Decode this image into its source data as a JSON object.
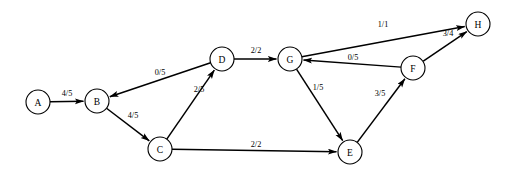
{
  "diagram": {
    "type": "flow-network",
    "label_format": "flow/capacity",
    "background_color": "#ffffff",
    "stroke_color": "#000000",
    "node_radius": 12,
    "nodes": [
      {
        "id": "A",
        "label": "A",
        "x": 38,
        "y": 102
      },
      {
        "id": "B",
        "label": "B",
        "x": 97,
        "y": 101
      },
      {
        "id": "C",
        "label": "C",
        "x": 160,
        "y": 149
      },
      {
        "id": "D",
        "label": "D",
        "x": 222,
        "y": 59
      },
      {
        "id": "E",
        "label": "E",
        "x": 350,
        "y": 152
      },
      {
        "id": "F",
        "label": "F",
        "x": 413,
        "y": 68
      },
      {
        "id": "G",
        "label": "G",
        "x": 290,
        "y": 59
      },
      {
        "id": "H",
        "label": "H",
        "x": 478,
        "y": 24
      }
    ],
    "edges": [
      {
        "id": "A-B",
        "from": "A",
        "to": "B",
        "label": "4/5",
        "flow": 4,
        "capacity": 5,
        "lx": 67,
        "ly": 93
      },
      {
        "id": "D-B",
        "from": "D",
        "to": "B",
        "label": "0/5",
        "flow": 0,
        "capacity": 5,
        "lx": 160,
        "ly": 72
      },
      {
        "id": "B-C",
        "from": "B",
        "to": "C",
        "label": "4/5",
        "flow": 4,
        "capacity": 5,
        "lx": 133,
        "ly": 115
      },
      {
        "id": "C-D",
        "from": "C",
        "to": "D",
        "label": "2/5",
        "flow": 2,
        "capacity": 5,
        "lx": 199,
        "ly": 89
      },
      {
        "id": "D-G",
        "from": "D",
        "to": "G",
        "label": "2/2",
        "flow": 2,
        "capacity": 2,
        "lx": 256,
        "ly": 50
      },
      {
        "id": "G-E",
        "from": "G",
        "to": "E",
        "label": "1/5",
        "flow": 1,
        "capacity": 5,
        "lx": 318,
        "ly": 87
      },
      {
        "id": "C-E",
        "from": "C",
        "to": "E",
        "label": "2/2",
        "flow": 2,
        "capacity": 2,
        "lx": 256,
        "ly": 144
      },
      {
        "id": "E-F",
        "from": "E",
        "to": "F",
        "label": "3/5",
        "flow": 3,
        "capacity": 5,
        "lx": 380,
        "ly": 93
      },
      {
        "id": "F-G",
        "from": "F",
        "to": "G",
        "label": "0/5",
        "flow": 0,
        "capacity": 5,
        "lx": 353,
        "ly": 57
      },
      {
        "id": "G-H",
        "from": "G",
        "to": "H",
        "label": "1/1",
        "flow": 1,
        "capacity": 1,
        "lx": 383,
        "ly": 24
      },
      {
        "id": "F-H",
        "from": "F",
        "to": "H",
        "label": "3/4",
        "flow": 3,
        "capacity": 4,
        "lx": 448,
        "ly": 33
      }
    ]
  }
}
